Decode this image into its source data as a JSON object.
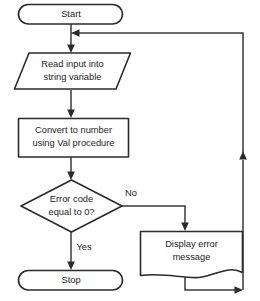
{
  "diagram": {
    "type": "flowchart",
    "colors": {
      "background": "#ffffff",
      "shape_stroke": "#2b2b2b",
      "connector_stroke": "#3a3a3a",
      "text": "#1c1c1c"
    },
    "nodes": [
      {
        "id": "start",
        "shape": "terminator",
        "label": "Start",
        "lines": [
          "Start"
        ]
      },
      {
        "id": "read-input",
        "shape": "parallelogram-input",
        "label": "Read input into string variable",
        "lines": [
          "Read input into",
          "string variable"
        ]
      },
      {
        "id": "convert",
        "shape": "process-rectangle",
        "label": "Convert to number using Val procedure",
        "lines": [
          "Convert to number",
          "using Val procedure"
        ]
      },
      {
        "id": "decision",
        "shape": "diamond-decision",
        "label": "Error code equal to 0?",
        "lines": [
          "Error code",
          "equal to 0?"
        ]
      },
      {
        "id": "stop",
        "shape": "terminator",
        "label": "Stop",
        "lines": [
          "Stop"
        ]
      },
      {
        "id": "display-error",
        "shape": "document",
        "label": "Display error message",
        "lines": [
          "Display error",
          "message"
        ]
      }
    ],
    "branch_labels": {
      "no": "No",
      "yes": "Yes"
    },
    "edges": [
      {
        "from": "start",
        "to": "read-input",
        "label": ""
      },
      {
        "from": "read-input",
        "to": "convert",
        "label": ""
      },
      {
        "from": "convert",
        "to": "decision",
        "label": ""
      },
      {
        "from": "decision",
        "to": "stop",
        "label": "Yes"
      },
      {
        "from": "decision",
        "to": "display-error",
        "label": "No"
      },
      {
        "from": "display-error",
        "to": "start",
        "label": ""
      }
    ]
  }
}
